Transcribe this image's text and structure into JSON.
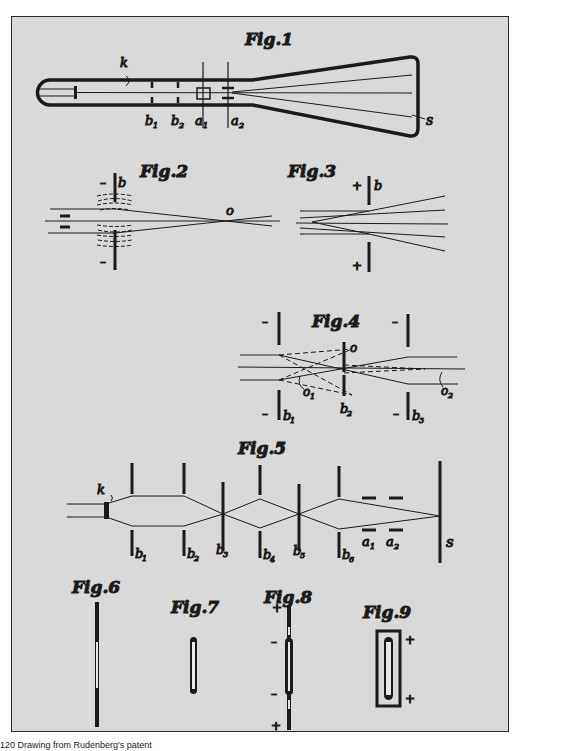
{
  "plate": {
    "background": "#d9d9d9",
    "ink": "#1a1a1a",
    "figures": [
      {
        "id": "fig1",
        "title": "Fig.1",
        "labels": {
          "k": "k",
          "b1": "b",
          "b1_sub": "1",
          "b2": "b",
          "b2_sub": "2",
          "a1": "a",
          "a1_sub": "1",
          "a2": "a",
          "a2_sub": "2",
          "s": "s"
        }
      },
      {
        "id": "fig2",
        "title": "Fig.2",
        "labels": {
          "b": "b",
          "o": "o",
          "minus_top": "–",
          "minus_bottom": "–"
        }
      },
      {
        "id": "fig3",
        "title": "Fig.3",
        "labels": {
          "b": "b",
          "plus_top": "+",
          "plus_bottom": "+"
        }
      },
      {
        "id": "fig4",
        "title": "Fig.4",
        "labels": {
          "o": "o",
          "o1": "o",
          "o1_sub": "1",
          "o2": "o",
          "o2_sub": "2",
          "b1": "b",
          "b1_sub": "1",
          "b2": "b",
          "b2_sub": "2",
          "b3": "b",
          "b3_sub": "3",
          "minus": "–"
        }
      },
      {
        "id": "fig5",
        "title": "Fig.5",
        "labels": {
          "k": "k",
          "b1": "b",
          "b1_sub": "1",
          "b2": "b",
          "b2_sub": "2",
          "b3": "b",
          "b3_sub": "3",
          "b4": "b",
          "b4_sub": "4",
          "b5": "b",
          "b5_sub": "5",
          "b6": "b",
          "b6_sub": "6",
          "a1": "a",
          "a1_sub": "1",
          "a2": "a",
          "a2_sub": "2",
          "s": "s"
        }
      },
      {
        "id": "fig6",
        "title": "Fig.6"
      },
      {
        "id": "fig7",
        "title": "Fig.7"
      },
      {
        "id": "fig8",
        "title": "Fig.8",
        "labels": {
          "plus": "+",
          "minus": "–"
        }
      },
      {
        "id": "fig9",
        "title": "Fig.9",
        "labels": {
          "plus": "+",
          "minus": "–"
        }
      }
    ]
  },
  "caption": "120   Drawing from Rudenberg's patent"
}
